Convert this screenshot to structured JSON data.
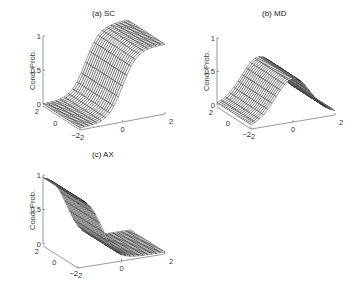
{
  "figure": {
    "panels": [
      {
        "id": "a",
        "title": "(a)  SC"
      },
      {
        "id": "b",
        "title": "(b)  MD"
      },
      {
        "id": "c",
        "title": "(c)  AX"
      }
    ]
  },
  "chart_data": [
    {
      "type": "surface",
      "title": "(a)  SC",
      "zlabel": "Cond. Prob.",
      "xlabel": "",
      "ylabel": "",
      "x_ticks": [
        "-2",
        "0",
        "2"
      ],
      "y_ticks": [
        "-2",
        "0",
        "2"
      ],
      "z_ticks": [
        "0",
        "0.5",
        "1"
      ],
      "xlim": [
        -2,
        2
      ],
      "ylim": [
        -2,
        2
      ],
      "zlim": [
        0,
        1
      ],
      "grid": false,
      "shape": "sigmoid rising along x (front axis), constant along y; ~0 at x=-2, ~1 at x=2",
      "function": "1/(1+exp(-3*x))",
      "mesh_lines": 21
    },
    {
      "type": "surface",
      "title": "(b)  MD",
      "zlabel": "Cond. Prob.",
      "xlabel": "",
      "ylabel": "",
      "x_ticks": [
        "-2",
        "0",
        "2"
      ],
      "y_ticks": [
        "-2",
        "0",
        "2"
      ],
      "z_ticks": [
        "0",
        "0.5",
        "1"
      ],
      "xlim": [
        -2,
        2
      ],
      "ylim": [
        -2,
        2
      ],
      "zlim": [
        0,
        1
      ],
      "grid": false,
      "shape": "plateau / bump centered at x=0, peak ~0.6, near 0 at x=±2",
      "function": "0.62*exp(-(x^2)/1.4)",
      "mesh_lines": 21
    },
    {
      "type": "surface",
      "title": "(c)  AX",
      "zlabel": "Cond. Prob.",
      "xlabel": "",
      "ylabel": "",
      "x_ticks": [
        "-2",
        "0",
        "2"
      ],
      "y_ticks": [
        "-2",
        "0",
        "2"
      ],
      "z_ticks": [
        "0",
        "0.5",
        "1"
      ],
      "xlim": [
        -2,
        2
      ],
      "ylim": [
        -2,
        2
      ],
      "zlim": [
        0,
        1
      ],
      "grid": false,
      "shape": "sigmoid falling along x; ~1 at x=-2, ~0.1 at x=0, ~0 at x=2",
      "function": "1/(1+exp(3*(x+0.9)))",
      "mesh_lines": 21
    }
  ]
}
